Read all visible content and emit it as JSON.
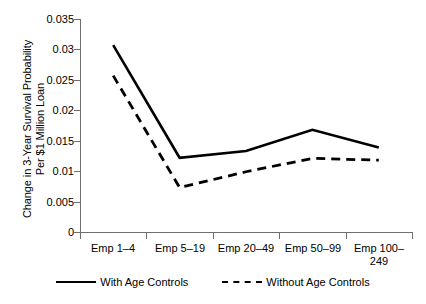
{
  "chart_data": {
    "type": "line",
    "title": "",
    "xlabel": "",
    "ylabel": "Change in 3-Year Survival Probability Per $1 Million Loan",
    "ylabel_lines": [
      "Change in 3-Year Survival Probability",
      "Per $1 Million Loan"
    ],
    "categories": [
      "Emp 1–4",
      "Emp 5–19",
      "Emp 20–49",
      "Emp 50–99",
      "Emp 100–\n249"
    ],
    "categories_flat": [
      "Emp 1–4",
      "Emp 5–19",
      "Emp 20–49",
      "Emp 50–99",
      "Emp 100–249"
    ],
    "series": [
      {
        "name": "With Age Controls",
        "style": "solid",
        "color": "#000000",
        "values": [
          0.0307,
          0.0122,
          0.0133,
          0.0168,
          0.0139
        ]
      },
      {
        "name": "Without Age Controls",
        "style": "dashed",
        "color": "#000000",
        "values": [
          0.0257,
          0.0073,
          0.0099,
          0.0121,
          0.0118
        ]
      }
    ],
    "ylim": [
      0,
      0.035
    ],
    "yticks": [
      "0",
      "0.005",
      "0.01",
      "0.015",
      "0.02",
      "0.025",
      "0.03",
      "0.035"
    ],
    "ytick_values": [
      0,
      0.005,
      0.01,
      0.015,
      0.02,
      0.025,
      0.03,
      0.035
    ],
    "grid": false,
    "legend_position": "bottom"
  },
  "legend": {
    "items": [
      {
        "label": "With Age Controls",
        "style": "solid"
      },
      {
        "label": "Without Age Controls",
        "style": "dashed"
      }
    ]
  },
  "axis": {
    "y_labels": [
      "0.035",
      "0.03",
      "0.025",
      "0.02",
      "0.015",
      "0.01",
      "0.005",
      "0"
    ],
    "x_labels": [
      "Emp 1–4",
      "Emp 5–19",
      "Emp 20–49",
      "Emp 50–99",
      "Emp 100–\n249"
    ]
  }
}
